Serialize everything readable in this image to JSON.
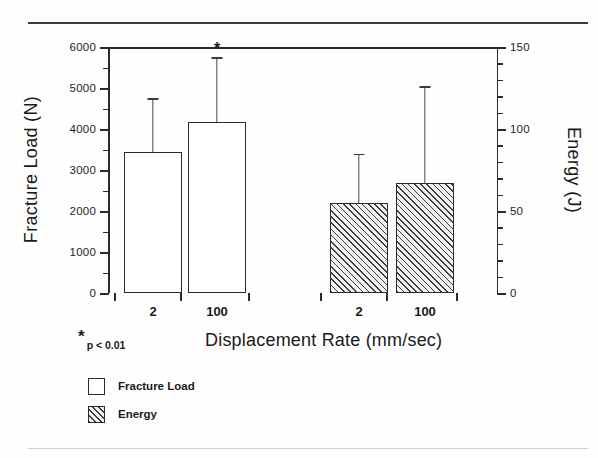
{
  "chart_data": {
    "type": "bar",
    "title": "",
    "xlabel": "Displacement Rate (mm/sec)",
    "ylabel": "Fracture Load (N)",
    "ylabel_secondary": "Energy (J)",
    "categories": [
      "2",
      "100",
      "2",
      "100"
    ],
    "ylim": [
      0,
      6000
    ],
    "ylim_secondary": [
      0,
      150
    ],
    "yticks": [
      0,
      1000,
      2000,
      3000,
      4000,
      5000,
      6000
    ],
    "yticks_secondary": [
      0,
      50,
      100,
      150
    ],
    "ytick_labels": [
      "0",
      "1000",
      "2000",
      "3000",
      "4000",
      "5000",
      "6000"
    ],
    "ytick_labels_secondary": [
      "0",
      "50",
      "100",
      "150"
    ],
    "yminor_interval": 500,
    "yminor_interval_secondary": 10,
    "grid": false,
    "legend_position": "below-left",
    "series": [
      {
        "name": "Fracture Load",
        "axis": "left",
        "unit": "N",
        "fill": "open",
        "points": [
          {
            "category": "2",
            "value": 3450,
            "error_high": 4750,
            "significant": false
          },
          {
            "category": "100",
            "value": 4180,
            "error_high": 5750,
            "significant": true
          }
        ]
      },
      {
        "name": "Energy",
        "axis": "right",
        "unit": "J",
        "fill": "hatched",
        "points": [
          {
            "category": "2",
            "value": 55,
            "error_high": 85,
            "significant": false
          },
          {
            "category": "100",
            "value": 67,
            "error_high": 126,
            "significant": false
          }
        ]
      }
    ],
    "annotations": [
      {
        "name": "significance-marker",
        "symbol": "*",
        "text": "p < 0.01"
      }
    ],
    "legend": [
      {
        "label": "Fracture Load",
        "swatch": "open-square"
      },
      {
        "label": "Energy",
        "swatch": "hatched-square"
      }
    ],
    "colors": {
      "axis": "#2a2a2a",
      "bar_outline": "#2b2b2b",
      "bar_fill_open": "#ffffff",
      "hatch": "#3c3c3c",
      "error_bar": "#4a4a4a",
      "background": "#fefefe"
    }
  }
}
